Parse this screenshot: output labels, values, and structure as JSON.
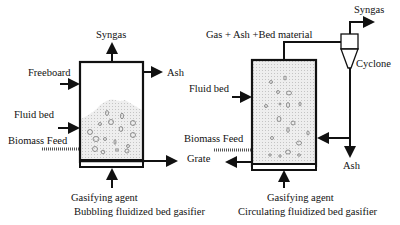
{
  "bubbling": {
    "syngas": "Syngas",
    "freeboard": "Freeboard",
    "ash": "Ash",
    "fluid_bed": "Fluid bed",
    "biomass_feed": "Biomass Feed",
    "grate": "Grate",
    "gasifying_agent": "Gasifying agent",
    "caption": "Bubbling fluidized bed gasifier"
  },
  "circulating": {
    "syngas": "Syngas",
    "gas_ash_bed": "Gas + Ash +Bed material",
    "cyclone": "Cyclone",
    "fluid_bed": "Fluid bed",
    "biomass_feed": "Biomass Feed",
    "ash": "Ash",
    "gasifying_agent": "Gasifying agent",
    "caption": "Circulating fluidized bed gasifier"
  },
  "colors": {
    "line": "#111111",
    "bed_fill": "#e8e8e8"
  }
}
